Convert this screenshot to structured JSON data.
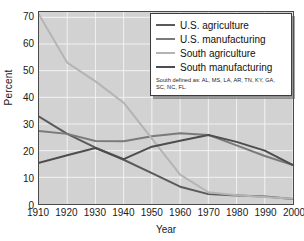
{
  "chart_data": {
    "type": "line",
    "title": "",
    "xlabel": "Year",
    "ylabel": "Percent",
    "xlim": [
      1910,
      2000
    ],
    "ylim": [
      0,
      72
    ],
    "grid": true,
    "legend_position": "top-right",
    "x": [
      1910,
      1920,
      1930,
      1940,
      1950,
      1960,
      1970,
      1980,
      1990,
      2000
    ],
    "xticks": [
      "1910",
      "1920",
      "1930",
      "1940",
      "1950",
      "1960",
      "1970",
      "1980",
      "1990",
      "2000"
    ],
    "yticks": [
      "0",
      "10",
      "20",
      "30",
      "40",
      "50",
      "60",
      "70"
    ],
    "ytick_values": [
      0,
      10,
      20,
      30,
      40,
      50,
      60,
      70
    ],
    "series": [
      {
        "name": "U.S. agriculture",
        "color": "#5a5a5a",
        "values": [
          32.8,
          26.3,
          21.1,
          16.6,
          11.6,
          6.5,
          3.7,
          3.2,
          2.8,
          1.9
        ]
      },
      {
        "name": "U.S. manufacturing",
        "color": "#7a7a7a",
        "values": [
          27.4,
          26.3,
          23.6,
          23.5,
          25.4,
          26.5,
          25.9,
          22.0,
          18.0,
          14.6
        ]
      },
      {
        "name": "South agriculture",
        "color": "#b4b4b4",
        "values": [
          71.0,
          53.0,
          46.0,
          38.0,
          24.5,
          11.0,
          4.4,
          3.3,
          2.6,
          2.0
        ]
      },
      {
        "name": "South manufacturing",
        "color": "#4d4d4d",
        "values": [
          15.5,
          18.3,
          21.0,
          16.8,
          21.5,
          23.7,
          25.9,
          23.3,
          20.0,
          14.6
        ]
      }
    ],
    "legend_note": "South defined as:  AL, MS, LA, AR, TN, KY, GA, SC, NC, FL."
  }
}
